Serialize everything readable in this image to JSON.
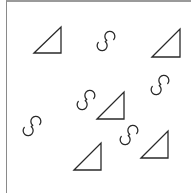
{
  "canvas": {
    "width": 191,
    "height": 193,
    "background": "#ffffff",
    "stroke_color": "#2a2a2a",
    "border_color": "#8a8a8a"
  },
  "triangles": [
    {
      "bl": [
        34,
        53
      ],
      "tr": [
        61,
        27
      ]
    },
    {
      "bl": [
        152,
        57
      ],
      "tr": [
        180,
        29
      ]
    },
    {
      "bl": [
        97,
        119
      ],
      "tr": [
        124,
        92
      ]
    },
    {
      "bl": [
        74,
        170
      ],
      "tr": [
        101,
        143
      ]
    },
    {
      "bl": [
        141,
        158
      ],
      "tr": [
        168,
        131
      ]
    }
  ],
  "s_shapes": [
    {
      "cx": 106,
      "cy": 41,
      "rot": 40
    },
    {
      "cx": 160,
      "cy": 85,
      "rot": 40
    },
    {
      "cx": 86,
      "cy": 100,
      "rot": 40
    },
    {
      "cx": 32,
      "cy": 126,
      "rot": 40
    },
    {
      "cx": 129,
      "cy": 135,
      "rot": 40
    }
  ]
}
